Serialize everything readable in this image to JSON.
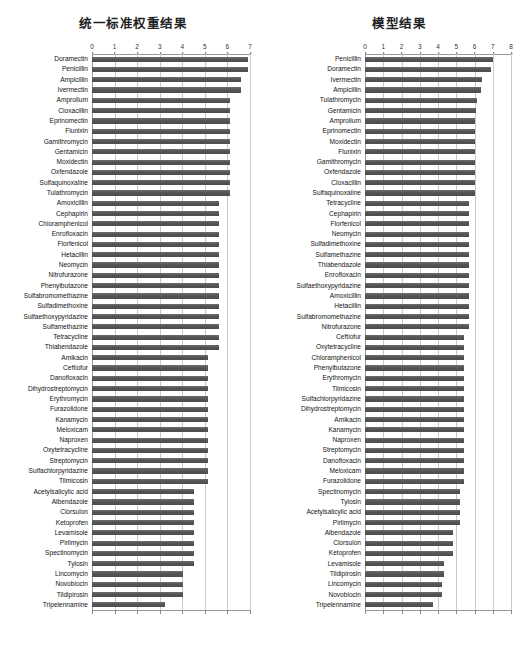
{
  "figure": {
    "panels": [
      {
        "key": "left",
        "title": "统一标准权重结果",
        "axis": {
          "min": 0,
          "max": 7,
          "ticks": [
            "0",
            "1",
            "2",
            "3",
            "4",
            "5",
            "6",
            "7"
          ]
        }
      },
      {
        "key": "right",
        "title": "模型结果",
        "axis": {
          "min": 0,
          "max": 8,
          "ticks": [
            "0",
            "1",
            "2",
            "3",
            "4",
            "5",
            "6",
            "7",
            "8"
          ]
        }
      }
    ]
  },
  "chart_data": [
    {
      "type": "bar",
      "orientation": "horizontal",
      "title": "统一标准权重结果",
      "xlabel": "",
      "ylabel": "",
      "xlim": [
        0,
        7
      ],
      "grid": true,
      "legend": false,
      "categories": [
        "Doramectin",
        "Penicillin",
        "Ampicillin",
        "Ivermectin",
        "Amprolium",
        "Cloxacillin",
        "Eprinomectin",
        "Flunixin",
        "Gamithromycin",
        "Gentamicin",
        "Moxidectin",
        "Oxfendazole",
        "Sulfaquinoxaline",
        "Tulathromycin",
        "Amoxicillin",
        "Cephapirin",
        "Chloramphenicol",
        "Enrofloxacin",
        "Florfenicol",
        "Hetacillin",
        "Neomycin",
        "Nitrofurazone",
        "Phenylbutazone",
        "Sulfabromomethazine",
        "Sulfadimethoxine",
        "Sulfaethoxypyridazine",
        "Sulfamethazine",
        "Tetracycline",
        "Thiabendazole",
        "Amikacin",
        "Ceftiofur",
        "Danofloxacin",
        "Dihydrostreptomycin",
        "Erythromycin",
        "Furazolidone",
        "Kanamycin",
        "Meloxicam",
        "Naproxen",
        "Oxytetracycline",
        "Streptomycin",
        "Sulfachlorpyridazine",
        "Tilmicosin",
        "Acetylsalicylic acid",
        "Albendazole",
        "Clorsulon",
        "Ketoprofen",
        "Levamisole",
        "Pirlimycin",
        "Spectinomycin",
        "Tylosin",
        "Lincomycin",
        "Novobiocin",
        "Tildipirosin",
        "Tripelennamine"
      ],
      "values": [
        6.92,
        6.92,
        6.58,
        6.58,
        6.12,
        6.12,
        6.12,
        6.12,
        6.12,
        6.12,
        6.12,
        6.12,
        6.12,
        6.12,
        5.62,
        5.62,
        5.62,
        5.62,
        5.62,
        5.62,
        5.62,
        5.62,
        5.62,
        5.62,
        5.62,
        5.62,
        5.62,
        5.62,
        5.62,
        5.12,
        5.12,
        5.12,
        5.12,
        5.12,
        5.12,
        5.12,
        5.12,
        5.12,
        5.12,
        5.12,
        5.12,
        5.12,
        4.5,
        4.5,
        4.5,
        4.5,
        4.5,
        4.5,
        4.5,
        4.5,
        4.02,
        4.02,
        4.02,
        3.22
      ]
    },
    {
      "type": "bar",
      "orientation": "horizontal",
      "title": "模型结果",
      "xlabel": "",
      "ylabel": "",
      "xlim": [
        0,
        8
      ],
      "grid": true,
      "legend": false,
      "categories": [
        "Penicillin",
        "Doramectin",
        "Ivermectin",
        "Ampicillin",
        "Tulathromycin",
        "Gentamicin",
        "Amprolium",
        "Eprinomectin",
        "Moxidectin",
        "Flunixin",
        "Gamithromycin",
        "Oxfendazole",
        "Cloxacillin",
        "Sulfaquinoxaline",
        "Tetracycline",
        "Cephapirin",
        "Florfenicol",
        "Neomycin",
        "Sulfadimethoxine",
        "Sulfamethazine",
        "Thiabendazole",
        "Enrofloxacin",
        "Sulfaethoxypyridazine",
        "Amoxicillin",
        "Hetacillin",
        "Sulfabromomethazine",
        "Nitrofurazone",
        "Ceftiofur",
        "Oxytetracycline",
        "Chloramphenicol",
        "Phenylbutazone",
        "Erythromycin",
        "Tilmicosin",
        "Sulfachlorpyridazine",
        "Dihydrostreptomycin",
        "Amikacin",
        "Kanamycin",
        "Naproxen",
        "Streptomycin",
        "Danofloxacin",
        "Meloxicam",
        "Furazolidone",
        "Spectinomycin",
        "Tylosin",
        "Acetylsalicylic acid",
        "Pirlimycin",
        "Albendazole",
        "Clorsulon",
        "Ketoprofen",
        "Levamisole",
        "Tildipirosin",
        "Lincomycin",
        "Novobiocin",
        "Tripelennamine"
      ],
      "values": [
        7.02,
        6.92,
        6.42,
        6.38,
        6.12,
        6.08,
        6.02,
        6.02,
        6.02,
        6.02,
        6.02,
        6.02,
        6.02,
        6.02,
        5.7,
        5.7,
        5.7,
        5.7,
        5.7,
        5.7,
        5.7,
        5.7,
        5.7,
        5.7,
        5.7,
        5.7,
        5.7,
        5.4,
        5.4,
        5.4,
        5.4,
        5.4,
        5.4,
        5.4,
        5.4,
        5.4,
        5.4,
        5.4,
        5.4,
        5.4,
        5.4,
        5.4,
        5.2,
        5.2,
        5.2,
        5.2,
        4.8,
        4.8,
        4.8,
        4.35,
        4.35,
        4.2,
        4.2,
        3.72
      ]
    }
  ]
}
